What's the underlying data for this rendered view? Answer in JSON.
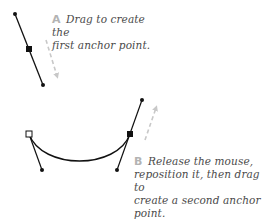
{
  "diagram": {
    "colors": {
      "path": "#111111",
      "direction_arrow": "#c8c8c8",
      "step_letter": "#b3b3b3",
      "caption_text": "#4a4a4a",
      "background": "#ffffff"
    },
    "steps": [
      {
        "letter": "A",
        "line1": "Drag to create the",
        "line2": "first anchor point."
      },
      {
        "letter": "B",
        "line1": "Release the mouse,",
        "line2": "reposition it, then drag to",
        "line3": "create a second anchor point."
      }
    ],
    "elements": {
      "step_a": {
        "anchor": {
          "x": 29,
          "y": 49,
          "style": "filled-square"
        },
        "handle_start": {
          "x": 15,
          "y": 14
        },
        "handle_end": {
          "x": 43,
          "y": 85
        },
        "drag_arrow": {
          "from": {
            "x": 46,
            "y": 40
          },
          "to": {
            "x": 58,
            "y": 80
          },
          "direction": "down"
        }
      },
      "step_b": {
        "first_anchor": {
          "x": 29,
          "y": 134,
          "style": "hollow-square"
        },
        "first_handle_end": {
          "x": 42,
          "y": 170
        },
        "second_anchor": {
          "x": 130,
          "y": 134,
          "style": "filled-square"
        },
        "second_handle_top": {
          "x": 142,
          "y": 100
        },
        "second_handle_bottom": {
          "x": 117,
          "y": 170
        },
        "curve": "M29,134 C42,170 117,170 130,134",
        "drag_arrow": {
          "from": {
            "x": 145,
            "y": 140
          },
          "to": {
            "x": 157,
            "y": 104
          },
          "direction": "up"
        }
      }
    }
  }
}
